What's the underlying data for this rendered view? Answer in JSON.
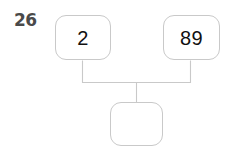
{
  "worksheet": {
    "problem_number": "26",
    "type": "number-bond"
  },
  "number_bond": {
    "parts": [
      {
        "id": "left",
        "value": "2",
        "empty": false
      },
      {
        "id": "right",
        "value": "89",
        "empty": false
      }
    ],
    "whole": {
      "id": "sum",
      "value": "",
      "empty": true
    }
  },
  "colors": {
    "box_border": "#c9c9c9",
    "connector_line": "#c9c9c9",
    "digit_text": "#111111",
    "problem_number_text": "#4a4a4a",
    "background": "#ffffff"
  }
}
